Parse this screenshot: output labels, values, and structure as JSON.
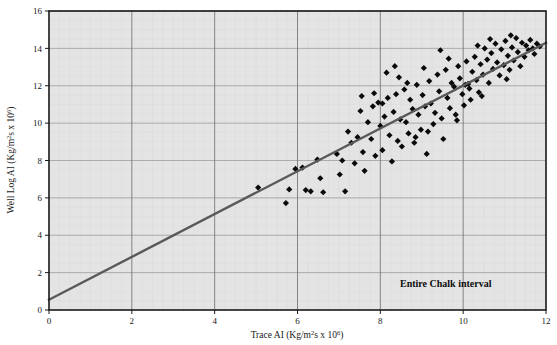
{
  "figure": {
    "background_color": "#ffffff",
    "plot_bg_color": "#e4e4e4",
    "frame_color": "#1a1a1a",
    "grid_color": "#9a9a9a",
    "marker_color": "#0a0a0a",
    "line_color": "#595959"
  },
  "axes": {
    "x_title_main": "Trace AI (Kg/m",
    "x_title_sup1": "2",
    "x_title_mid": "s x 10",
    "x_title_sup2": "6",
    "x_title_end": ")",
    "y_title_main": "Well Log AI (Kg/m",
    "y_title_sup1": "2",
    "y_title_mid": "s x 10",
    "y_title_sup2": "6",
    "y_title_end": ")",
    "x_ticks": [
      "0",
      "2",
      "4",
      "6",
      "8",
      "10",
      "12"
    ],
    "y_ticks": [
      "0",
      "2",
      "4",
      "6",
      "8",
      "10",
      "12",
      "14",
      "16"
    ]
  },
  "annotation": {
    "text": "Entire Chalk interval"
  },
  "chart_data": {
    "type": "scatter",
    "title": "",
    "xlabel": "Trace AI (Kg/m2s x 10^6)",
    "ylabel": "Well Log AI (Kg/m2s x 10^6)",
    "xlim": [
      0,
      12
    ],
    "ylim": [
      0,
      16
    ],
    "xticks": [
      0,
      2,
      4,
      6,
      8,
      10,
      12
    ],
    "yticks": [
      0,
      2,
      4,
      6,
      8,
      10,
      12,
      14,
      16
    ],
    "grid": true,
    "legend": false,
    "annotations": [
      {
        "text": "Entire Chalk interval",
        "x": 9.3,
        "y": 1.9
      }
    ],
    "trendline": {
      "type": "linear",
      "x": [
        0,
        12
      ],
      "y": [
        0.55,
        14.3
      ],
      "slope": 1.146,
      "intercept": 0.55,
      "color": "#595959"
    },
    "series": [
      {
        "name": "Chalk samples",
        "marker": "diamond",
        "color": "#0a0a0a",
        "points": [
          [
            5.05,
            6.55
          ],
          [
            5.72,
            5.72
          ],
          [
            5.8,
            6.45
          ],
          [
            5.95,
            7.55
          ],
          [
            6.12,
            7.62
          ],
          [
            6.2,
            6.42
          ],
          [
            6.32,
            6.35
          ],
          [
            6.48,
            8.05
          ],
          [
            6.55,
            7.05
          ],
          [
            6.62,
            6.3
          ],
          [
            6.95,
            8.35
          ],
          [
            7.02,
            7.25
          ],
          [
            7.08,
            8.0
          ],
          [
            7.15,
            6.35
          ],
          [
            7.22,
            9.55
          ],
          [
            7.3,
            8.95
          ],
          [
            7.38,
            7.85
          ],
          [
            7.45,
            9.25
          ],
          [
            7.52,
            10.65
          ],
          [
            7.58,
            8.45
          ],
          [
            7.62,
            7.45
          ],
          [
            7.7,
            10.05
          ],
          [
            7.78,
            9.15
          ],
          [
            7.82,
            10.9
          ],
          [
            7.88,
            8.25
          ],
          [
            7.95,
            11.1
          ],
          [
            8.0,
            9.85
          ],
          [
            8.05,
            8.55
          ],
          [
            8.1,
            10.35
          ],
          [
            8.18,
            11.35
          ],
          [
            8.22,
            9.35
          ],
          [
            8.28,
            7.95
          ],
          [
            8.32,
            10.6
          ],
          [
            8.38,
            11.55
          ],
          [
            8.42,
            9.05
          ],
          [
            8.48,
            10.2
          ],
          [
            8.52,
            8.75
          ],
          [
            8.58,
            11.8
          ],
          [
            8.62,
            10.05
          ],
          [
            8.68,
            9.45
          ],
          [
            8.72,
            11.25
          ],
          [
            8.78,
            10.75
          ],
          [
            8.82,
            8.95
          ],
          [
            8.88,
            12.05
          ],
          [
            8.92,
            10.45
          ],
          [
            8.98,
            9.65
          ],
          [
            9.02,
            11.5
          ],
          [
            9.08,
            10.9
          ],
          [
            9.12,
            8.35
          ],
          [
            9.18,
            12.25
          ],
          [
            9.22,
            11.05
          ],
          [
            9.28,
            9.95
          ],
          [
            9.32,
            10.55
          ],
          [
            9.38,
            12.6
          ],
          [
            9.42,
            11.7
          ],
          [
            9.48,
            10.25
          ],
          [
            9.52,
            9.15
          ],
          [
            9.58,
            12.85
          ],
          [
            9.62,
            11.35
          ],
          [
            9.68,
            10.8
          ],
          [
            9.72,
            12.15
          ],
          [
            9.78,
            11.95
          ],
          [
            9.82,
            10.45
          ],
          [
            9.88,
            13.05
          ],
          [
            9.92,
            12.4
          ],
          [
            9.98,
            11.55
          ],
          [
            10.02,
            10.95
          ],
          [
            10.08,
            13.3
          ],
          [
            10.12,
            12.1
          ],
          [
            10.18,
            11.25
          ],
          [
            10.22,
            12.75
          ],
          [
            10.28,
            13.55
          ],
          [
            10.32,
            12.3
          ],
          [
            10.38,
            11.65
          ],
          [
            10.42,
            13.15
          ],
          [
            10.48,
            12.6
          ],
          [
            10.52,
            14.0
          ],
          [
            10.58,
            13.4
          ],
          [
            10.62,
            12.15
          ],
          [
            10.68,
            13.75
          ],
          [
            10.72,
            12.9
          ],
          [
            10.78,
            14.25
          ],
          [
            10.82,
            13.25
          ],
          [
            10.88,
            12.55
          ],
          [
            10.92,
            13.95
          ],
          [
            10.98,
            13.1
          ],
          [
            11.02,
            14.4
          ],
          [
            11.08,
            13.6
          ],
          [
            11.12,
            12.85
          ],
          [
            11.18,
            14.05
          ],
          [
            11.22,
            13.35
          ],
          [
            11.28,
            14.55
          ],
          [
            11.32,
            13.8
          ],
          [
            11.38,
            13.05
          ],
          [
            11.42,
            14.3
          ],
          [
            11.48,
            13.55
          ],
          [
            11.52,
            14.15
          ],
          [
            11.58,
            13.9
          ],
          [
            11.62,
            14.45
          ],
          [
            11.68,
            14.0
          ],
          [
            11.72,
            13.7
          ],
          [
            11.78,
            14.25
          ],
          [
            11.85,
            14.1
          ],
          [
            8.45,
            12.45
          ],
          [
            9.05,
            12.95
          ],
          [
            10.05,
            12.05
          ],
          [
            10.35,
            14.15
          ],
          [
            11.05,
            12.35
          ],
          [
            9.65,
            13.45
          ],
          [
            8.15,
            12.7
          ],
          [
            7.85,
            11.6
          ],
          [
            8.35,
            13.05
          ],
          [
            9.45,
            13.9
          ],
          [
            10.65,
            14.5
          ],
          [
            11.15,
            14.7
          ],
          [
            7.55,
            11.45
          ],
          [
            8.65,
            12.15
          ],
          [
            9.85,
            10.15
          ],
          [
            10.45,
            11.45
          ],
          [
            8.05,
            11.05
          ],
          [
            8.85,
            9.25
          ],
          [
            9.15,
            9.55
          ],
          [
            10.15,
            11.85
          ]
        ]
      }
    ]
  }
}
